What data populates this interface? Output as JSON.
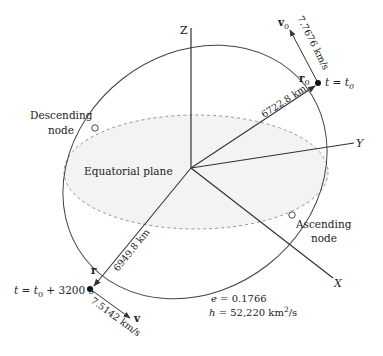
{
  "figure": {
    "axes": {
      "z_label": "Z",
      "y_label": "Y",
      "x_label": "X"
    },
    "plane_label": "Equatorial plane",
    "nodes": {
      "descending_line1": "Descending",
      "descending_line2": "node",
      "ascending_line1": "Ascending",
      "ascending_line2": "node"
    },
    "initial_state": {
      "velocity_symbol": "v",
      "velocity_sub": "0",
      "velocity_value": "7.7676 km/s",
      "position_symbol": "r",
      "position_sub": "0",
      "position_value": "6722.8 km",
      "time_label": "t = t",
      "time_sub": "0"
    },
    "final_state": {
      "velocity_symbol": "v",
      "velocity_value": "7.5142 km/s",
      "position_symbol": "r",
      "position_value": "6949.8 km",
      "time_prefix": "t = t",
      "time_sub": "0",
      "time_suffix": " + 3200 s"
    },
    "orbit_params": {
      "e_label": "e",
      "e_value": " = 0.1766",
      "h_label": "h",
      "h_value": " = 52,220 km",
      "h_exp": "2",
      "h_unit": "/s"
    },
    "colors": {
      "line": "#333333",
      "dashed": "#888888",
      "plane_fill": "#f3f3f3"
    }
  }
}
